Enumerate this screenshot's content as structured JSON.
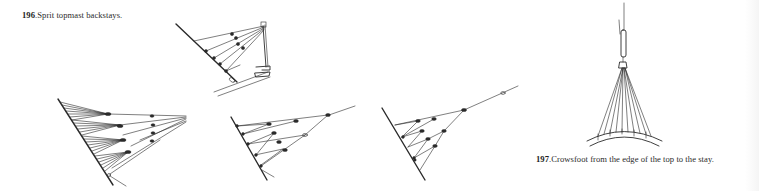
{
  "figures": [
    {
      "number": "196",
      "separator": ".",
      "caption": "Sprit topmast backstays.",
      "drawings": [
        "sprit-topmast-backstay-rig-with-mast",
        "backstay-crowsfoot-many-legs",
        "backstay-crowsfoot-euphroes",
        "backstay-crowsfoot-single-pendant"
      ]
    },
    {
      "number": "197",
      "separator": ".",
      "caption": "Crowsfoot from the edge of the top to the stay.",
      "drawings": [
        "crowsfoot-top-to-stay"
      ]
    }
  ],
  "colors": {
    "background": "#ffffff",
    "ink": "#2a2a2a"
  }
}
